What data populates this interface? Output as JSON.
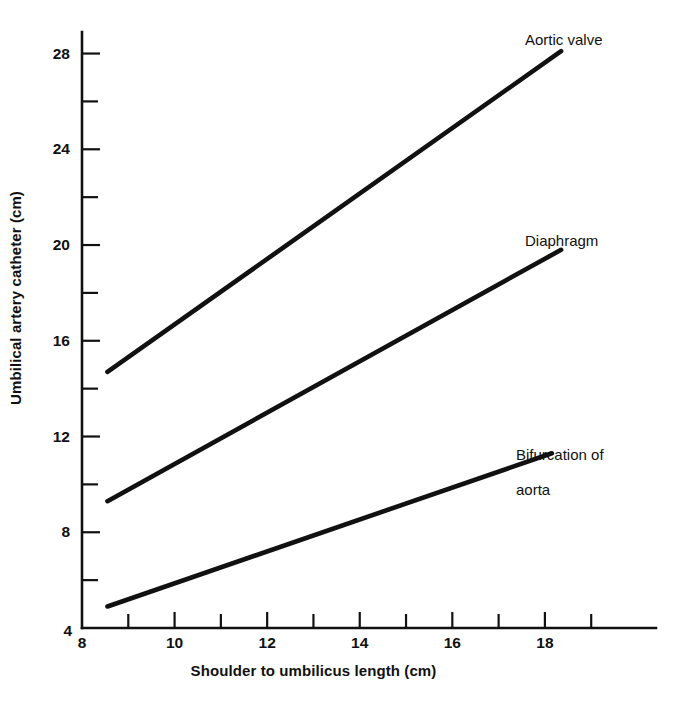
{
  "chart_data": {
    "type": "line",
    "title": "",
    "xlabel": "Shoulder to umbilicus length (cm)",
    "ylabel": "Umbilical artery catheter (cm)",
    "xlim": [
      8,
      20.4
    ],
    "ylim": [
      4,
      28.9
    ],
    "xticks": [
      8,
      10,
      12,
      14,
      16,
      18
    ],
    "xtick_labels": [
      "8",
      "10",
      "12",
      "14",
      "16",
      "18"
    ],
    "xminor_ticks": [
      9,
      11,
      13,
      15,
      17,
      19
    ],
    "yticks": [
      4,
      8,
      12,
      16,
      20,
      24,
      28
    ],
    "ytick_labels": [
      "4",
      "8",
      "12",
      "16",
      "20",
      "24",
      "28"
    ],
    "yminor_ticks": [
      6,
      10,
      14,
      18,
      22,
      26
    ],
    "grid": false,
    "legend": "inline-annotations",
    "series": [
      {
        "name": "Aortic valve",
        "label": "Aortic valve",
        "x": [
          8.55,
          18.35
        ],
        "y": [
          14.7,
          28.1
        ],
        "color": "#111111"
      },
      {
        "name": "Diaphragm",
        "label": "Diaphragm",
        "x": [
          8.55,
          18.35
        ],
        "y": [
          9.3,
          19.8
        ],
        "color": "#111111"
      },
      {
        "name": "Bifurcation of aorta",
        "label": "Bifurcation of\naorta",
        "x": [
          8.55,
          18.15
        ],
        "y": [
          4.9,
          11.3
        ],
        "color": "#111111"
      }
    ]
  },
  "annotations": {
    "aortic_valve": "Aortic valve",
    "diaphragm": "Diaphragm",
    "bifurcation_line1": "Bifurcation of",
    "bifurcation_line2": "aorta"
  },
  "axis": {
    "x_title": "Shoulder to umbilicus length (cm)",
    "y_title": "Umbilical artery catheter (cm)"
  },
  "colors": {
    "ink": "#111111",
    "paper": "#ffffff"
  }
}
